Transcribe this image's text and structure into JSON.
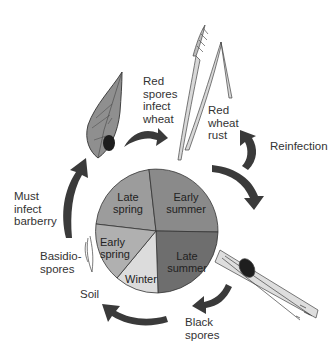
{
  "diagram": {
    "pie": {
      "segments": [
        {
          "id": "late-spring",
          "label": "Late\nspring",
          "color": "#9c9c9c"
        },
        {
          "id": "early-summer",
          "label": "Early\nsummer",
          "color": "#8a8a8a"
        },
        {
          "id": "late-summer",
          "label": "Late\nsummer",
          "color": "#6e6e6e"
        },
        {
          "id": "winter",
          "label": "Winter",
          "color": "#dcdcdc"
        },
        {
          "id": "early-spring",
          "label": "Early\nspring",
          "color": "#b0b0b0"
        }
      ]
    },
    "labels": {
      "red_spores": "Red\nspores\ninfect\nwheat",
      "red_wheat_rust": "Red\nwheat\nrust",
      "reinfection": "Reinfection",
      "must_infect": "Must\ninfect\nbarberry",
      "basidiospores": "Basidio-\nspores",
      "soil": "Soil",
      "black_spores": "Black\nspores"
    },
    "colors": {
      "arrow": "#3a3a3a",
      "leaf": "#8f8f8f",
      "wheat": "#d8d8d8"
    }
  }
}
